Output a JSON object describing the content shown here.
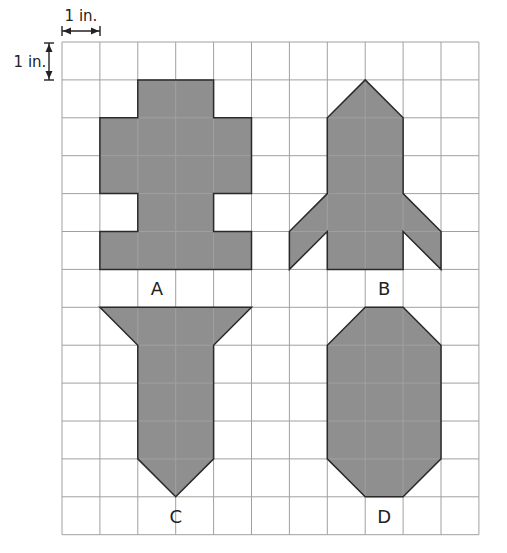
{
  "grid": {
    "origin_x": 62,
    "origin_y": 42,
    "cell_size": 37.9,
    "columns": 11,
    "rows": 13,
    "line_color": "#a0a0a0",
    "inner_line_color": "#6a6a6a"
  },
  "scale": {
    "horizontal_label": "1 in.",
    "vertical_label": "1 in."
  },
  "colors": {
    "shape_fill": "#8f8f8f",
    "shape_stroke": "#2a2a2a",
    "text": "#222222"
  },
  "shapes": [
    {
      "id": "A",
      "label": "A",
      "points_grid": [
        [
          2,
          1
        ],
        [
          4,
          1
        ],
        [
          4,
          2
        ],
        [
          5,
          2
        ],
        [
          5,
          4
        ],
        [
          4,
          4
        ],
        [
          4,
          5
        ],
        [
          5,
          5
        ],
        [
          5,
          6
        ],
        [
          1,
          6
        ],
        [
          1,
          5
        ],
        [
          2,
          5
        ],
        [
          2,
          4
        ],
        [
          1,
          4
        ],
        [
          1,
          2
        ],
        [
          2,
          2
        ]
      ],
      "label_pos_grid": [
        2.5,
        6.5
      ]
    },
    {
      "id": "B",
      "label": "B",
      "points_grid": [
        [
          8,
          1
        ],
        [
          9,
          2
        ],
        [
          9,
          4
        ],
        [
          10,
          5
        ],
        [
          10,
          6
        ],
        [
          9,
          5
        ],
        [
          9,
          6
        ],
        [
          7,
          6
        ],
        [
          7,
          5
        ],
        [
          6,
          6
        ],
        [
          6,
          5
        ],
        [
          7,
          4
        ],
        [
          7,
          2
        ]
      ],
      "label_pos_grid": [
        8.5,
        6.5
      ]
    },
    {
      "id": "C",
      "label": "C",
      "points_grid": [
        [
          1,
          7
        ],
        [
          5,
          7
        ],
        [
          4,
          8
        ],
        [
          4,
          11
        ],
        [
          3,
          12
        ],
        [
          2,
          11
        ],
        [
          2,
          8
        ]
      ],
      "label_pos_grid": [
        3.0,
        12.5
      ]
    },
    {
      "id": "D",
      "label": "D",
      "points_grid": [
        [
          8,
          7
        ],
        [
          9,
          7
        ],
        [
          10,
          8
        ],
        [
          10,
          11
        ],
        [
          9,
          12
        ],
        [
          8,
          12
        ],
        [
          7,
          11
        ],
        [
          7,
          8
        ]
      ],
      "label_pos_grid": [
        8.5,
        12.5
      ]
    }
  ]
}
